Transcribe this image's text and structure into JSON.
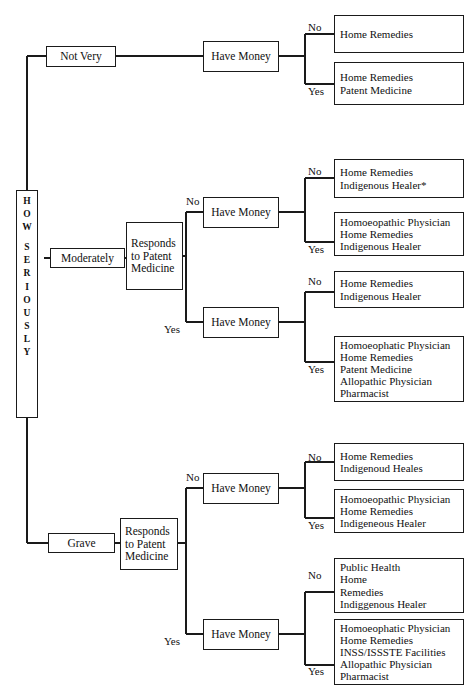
{
  "diagram": {
    "type": "decision-tree",
    "spine_label": "HOW SERIOUSLY",
    "spine_letters": [
      "H",
      "O",
      "W",
      "",
      "S",
      "E",
      "R",
      "I",
      "O",
      "U",
      "S",
      "L",
      "Y"
    ],
    "node_labels": {
      "not_very": "Not Very",
      "moderately": "Moderately",
      "grave": "Grave",
      "responds": "Responds\nto Patent\nMedicine",
      "have_money": "Have Money"
    },
    "edge_labels": {
      "yes": "Yes",
      "no": "No"
    },
    "footnote": "*"
  },
  "branches": [
    {
      "severity": "Not Very",
      "responds_to_patent_medicine": null,
      "money_nodes": [
        {
          "label": "Have Money",
          "outcomes": [
            {
              "edge": "No",
              "items": [
                "Home Remedies"
              ]
            },
            {
              "edge": "Yes",
              "items": [
                "Home Remedies",
                "Patent Medicine"
              ]
            }
          ]
        }
      ]
    },
    {
      "severity": "Moderately",
      "responds_to_patent_medicine": "Responds to Patent Medicine",
      "money_nodes": [
        {
          "edge": "No",
          "label": "Have Money",
          "outcomes": [
            {
              "edge": "No",
              "items": [
                "Home Remedies",
                "Indigenous Healer*"
              ]
            },
            {
              "edge": "Yes",
              "items": [
                "Homoeopathic Physician",
                "Home Remedies",
                "Indigenous Healer"
              ]
            }
          ]
        },
        {
          "edge": "Yes",
          "label": "Have Money",
          "outcomes": [
            {
              "edge": "No",
              "items": [
                "Home Remedies",
                "Indigenous Healer"
              ]
            },
            {
              "edge": "Yes",
              "items": [
                "Homoeophatic Physician",
                "Home Remedies",
                "Patent Medicine",
                "Allopathic Physician",
                "Pharmacist"
              ]
            }
          ]
        }
      ]
    },
    {
      "severity": "Grave",
      "responds_to_patent_medicine": "Responds to Patent Medicine",
      "money_nodes": [
        {
          "edge": "No",
          "label": "Have Money",
          "outcomes": [
            {
              "edge": "No",
              "items": [
                "Home Remedies",
                "Indigenoud Heales"
              ]
            },
            {
              "edge": "Yes",
              "items": [
                "Homoeopathic Physician",
                "Home Remedies",
                "Indigeneous Healer"
              ]
            }
          ]
        },
        {
          "edge": "Yes",
          "label": "Have Money",
          "outcomes": [
            {
              "edge": "No",
              "items": [
                "Public Health",
                "Home",
                "Remedies",
                "Indiggenous Healer"
              ]
            },
            {
              "edge": "Yes",
              "items": [
                "Homoeophatic Physician",
                "Home Remedies",
                "INSS/ISSSTE Facilities",
                "Allopathic Physician",
                "Pharmacist"
              ]
            }
          ]
        }
      ]
    }
  ],
  "text": {
    "b1_leaf1": "Home Remedies",
    "b1_leaf2": "Home Remedies\nPatent Medicine",
    "b2a_leaf1": "Home Remedies\nIndigenous Healer*",
    "b2a_leaf2": "Homoeopathic Physician\nHome Remedies\nIndigenous Healer",
    "b2b_leaf1": "Home Remedies\nIndigenous Healer",
    "b2b_leaf2": "Homoeophatic Physician\nHome Remedies\nPatent Medicine\nAllopathic Physician\nPharmacist",
    "b3a_leaf1": "Home Remedies\nIndigenoud Heales",
    "b3a_leaf2": "Homoeopathic Physician\nHome Remedies\nIndigeneous Healer",
    "b3b_leaf1": "Public Health\nHome\nRemedies\nIndiggenous Healer",
    "b3b_leaf2": "Homoeophatic Physician\nHome Remedies\nINSS/ISSSTE Facilities\nAllopathic Physician\nPharmacist"
  },
  "colors": {
    "stroke": "#1a1a1a",
    "background": "#ffffff",
    "text": "#111111"
  }
}
